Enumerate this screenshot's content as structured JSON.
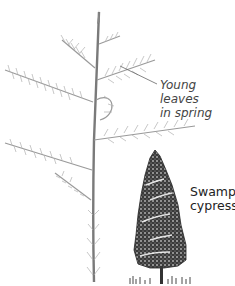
{
  "figure": {
    "annotations": {
      "young_leaves": {
        "line1": "Young leaves",
        "line2": "in spring"
      },
      "swamp_cypress": {
        "line1": "Swamp",
        "line2": "cypress"
      }
    },
    "colors": {
      "stem": "#7a7a7a",
      "needles": "#9a9a9a",
      "tree_dark": "#2a2a2a",
      "leader_line": "#666666",
      "background": "#ffffff"
    }
  }
}
